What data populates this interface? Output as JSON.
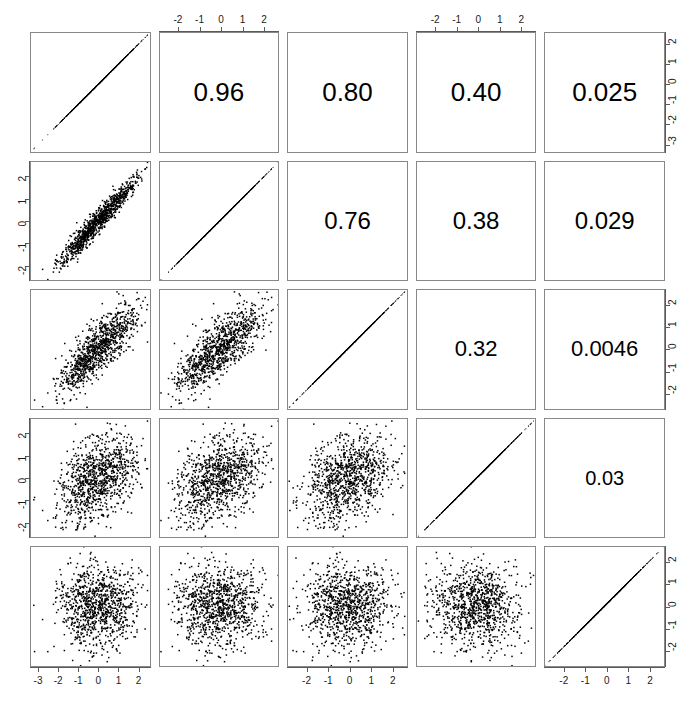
{
  "chart_data": {
    "type": "scatter",
    "plot_kind": "scatterplot-matrix",
    "title": "",
    "subtitle": "",
    "xlabel": "",
    "ylabel": "",
    "grid": false,
    "legend": null,
    "n_variables": 5,
    "n_points": 1000,
    "variables": [
      "V1",
      "V2",
      "V3",
      "V4",
      "V5"
    ],
    "diagonal_content": "perfect-correlation-line",
    "upper_triangle_content": "correlation-coefficient-text",
    "lower_triangle_content": "scatter-points",
    "point_color": "#000000",
    "panel_border_color": "#888888",
    "axis_color": "#5a5a5a",
    "background_color": "#ffffff",
    "correlation_matrix": [
      [
        1,
        0.96,
        0.8,
        0.4,
        0.025
      ],
      [
        0.96,
        1,
        0.76,
        0.38,
        0.029
      ],
      [
        0.8,
        0.76,
        1,
        0.32,
        0.0046
      ],
      [
        0.4,
        0.38,
        0.32,
        1,
        0.03
      ],
      [
        0.025,
        0.029,
        0.0046,
        0.03,
        1
      ]
    ],
    "correlation_labels": [
      {
        "row": 1,
        "col": 2,
        "text": "0.96",
        "font_size": 26
      },
      {
        "row": 1,
        "col": 3,
        "text": "0.80",
        "font_size": 26
      },
      {
        "row": 1,
        "col": 4,
        "text": "0.40",
        "font_size": 26
      },
      {
        "row": 1,
        "col": 5,
        "text": "0.025",
        "font_size": 26
      },
      {
        "row": 2,
        "col": 3,
        "text": "0.76",
        "font_size": 24
      },
      {
        "row": 2,
        "col": 4,
        "text": "0.38",
        "font_size": 24
      },
      {
        "row": 2,
        "col": 5,
        "text": "0.029",
        "font_size": 24
      },
      {
        "row": 3,
        "col": 4,
        "text": "0.32",
        "font_size": 22
      },
      {
        "row": 3,
        "col": 5,
        "text": "0.0046",
        "font_size": 22
      },
      {
        "row": 4,
        "col": 5,
        "text": "0.03",
        "font_size": 20
      }
    ],
    "axes": {
      "top": [
        {
          "col": 2,
          "ticks": [
            "-2",
            "-1",
            "0",
            "1",
            "2"
          ],
          "values": [
            -2,
            -1,
            0,
            1,
            2
          ],
          "range": [
            -2.9,
            2.7
          ]
        },
        {
          "col": 4,
          "ticks": [
            "-2",
            "-1",
            "0",
            "1",
            "2"
          ],
          "values": [
            -2,
            -1,
            0,
            1,
            2
          ],
          "range": [
            -2.9,
            2.7
          ]
        }
      ],
      "bottom": [
        {
          "col": 1,
          "ticks": [
            "-3",
            "-2",
            "-1",
            "0",
            "1",
            "2"
          ],
          "values": [
            -3,
            -2,
            -1,
            0,
            1,
            2
          ],
          "range": [
            -3.4,
            2.6
          ]
        },
        {
          "col": 3,
          "ticks": [
            "-2",
            "-1",
            "0",
            "1",
            "2"
          ],
          "values": [
            -2,
            -1,
            0,
            1,
            2
          ],
          "range": [
            -2.9,
            2.7
          ]
        },
        {
          "col": 5,
          "ticks": [
            "-2",
            "-1",
            "0",
            "1",
            "2"
          ],
          "values": [
            -2,
            -1,
            0,
            1,
            2
          ],
          "range": [
            -2.9,
            2.7
          ]
        }
      ],
      "left": [
        {
          "row": 2,
          "ticks": [
            "2",
            "1",
            "0",
            "-1",
            "-2"
          ],
          "values": [
            2,
            1,
            0,
            -1,
            -2
          ],
          "range": [
            -2.7,
            2.7
          ]
        },
        {
          "row": 4,
          "ticks": [
            "2",
            "1",
            "0",
            "-1",
            "-2"
          ],
          "values": [
            2,
            1,
            0,
            -1,
            -2
          ],
          "range": [
            -2.7,
            2.7
          ]
        }
      ],
      "right": [
        {
          "row": 1,
          "ticks": [
            "2",
            "1",
            "0",
            "-1",
            "-2",
            "-3"
          ],
          "values": [
            2,
            1,
            0,
            -1,
            -2,
            -3
          ],
          "range": [
            -3.4,
            2.6
          ]
        },
        {
          "row": 3,
          "ticks": [
            "2",
            "1",
            "0",
            "-1",
            "-2"
          ],
          "values": [
            2,
            1,
            0,
            -1,
            -2
          ],
          "range": [
            -2.7,
            2.7
          ]
        },
        {
          "row": 5,
          "ticks": [
            "2",
            "1",
            "0",
            "-1",
            "-2"
          ],
          "values": [
            2,
            1,
            0,
            -1,
            -2
          ],
          "range": [
            -2.7,
            2.7
          ]
        }
      ]
    }
  }
}
